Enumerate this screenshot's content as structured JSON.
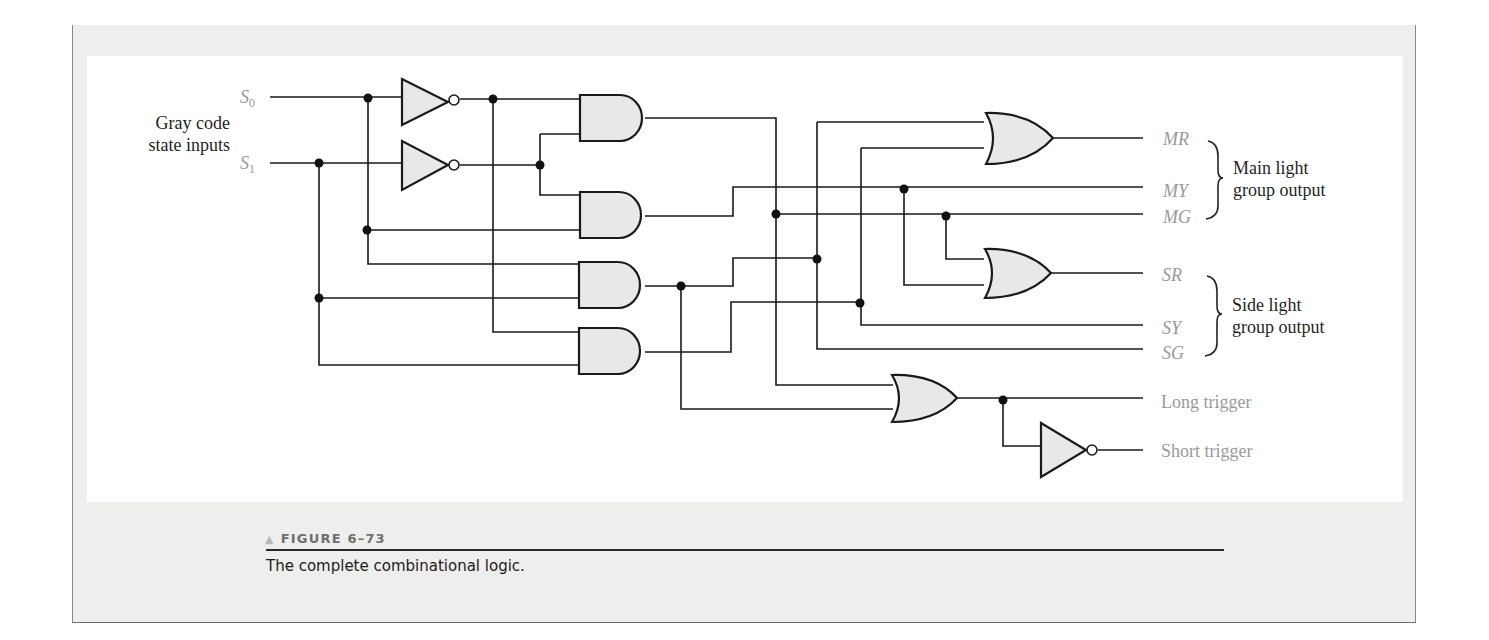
{
  "figure": {
    "number_label": "FIGURE 6–73",
    "marker_icon": "triangle-marker",
    "caption": "The complete combinational logic."
  },
  "inputs": {
    "group_label_line1": "Gray code",
    "group_label_line2": "state inputs",
    "signals": [
      {
        "name": "S",
        "subscript": "0"
      },
      {
        "name": "S",
        "subscript": "1"
      }
    ]
  },
  "outputs": {
    "main_group": {
      "label_line1": "Main light",
      "label_line2": "group output",
      "signals": [
        "MR",
        "MY",
        "MG"
      ]
    },
    "side_group": {
      "label_line1": "Side light",
      "label_line2": "group output",
      "signals": [
        "SR",
        "SY",
        "SG"
      ]
    },
    "triggers": [
      "Long trigger",
      "Short trigger"
    ]
  },
  "components": {
    "inverters": 3,
    "and_gates": 4,
    "or_gates": 3
  },
  "colors": {
    "gate_fill": "#e8e8e6",
    "wire": "#1a1a1a",
    "signal_label": "#9a9a9a",
    "frame_bg": "#eeeeec"
  }
}
